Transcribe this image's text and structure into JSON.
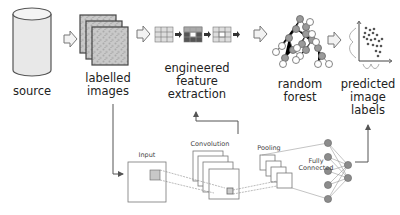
{
  "diagram": {
    "pipeline": [
      {
        "id": "source",
        "label": "source",
        "icon": "database-cylinder-icon"
      },
      {
        "id": "labelled_images",
        "label_line1": "labelled",
        "label_line2": "images",
        "icon": "image-stack-icon"
      },
      {
        "id": "feature_extraction",
        "label_line1": "engineered",
        "label_line2": "feature",
        "label_line3": "extraction",
        "icon": "convolution-steps-icon"
      },
      {
        "id": "random_forest",
        "label_line1": "random",
        "label_line2": "forest",
        "icon": "tree-graph-icon"
      },
      {
        "id": "predicted_labels",
        "label_line1": "predicted",
        "label_line2": "image",
        "label_line3": "labels",
        "icon": "scatter-plot-icon"
      }
    ],
    "cnn": {
      "input_label": "Input",
      "convolution_label": "Convolution",
      "pooling_label": "Pooling",
      "fc_label_line1": "Fully",
      "fc_label_line2": "Connected"
    },
    "colors": {
      "stroke": "#666666",
      "fill_light": "#e6e6e6",
      "node_fill": "#8c8c8c",
      "arrow_fill": "#f2f2f2"
    }
  }
}
